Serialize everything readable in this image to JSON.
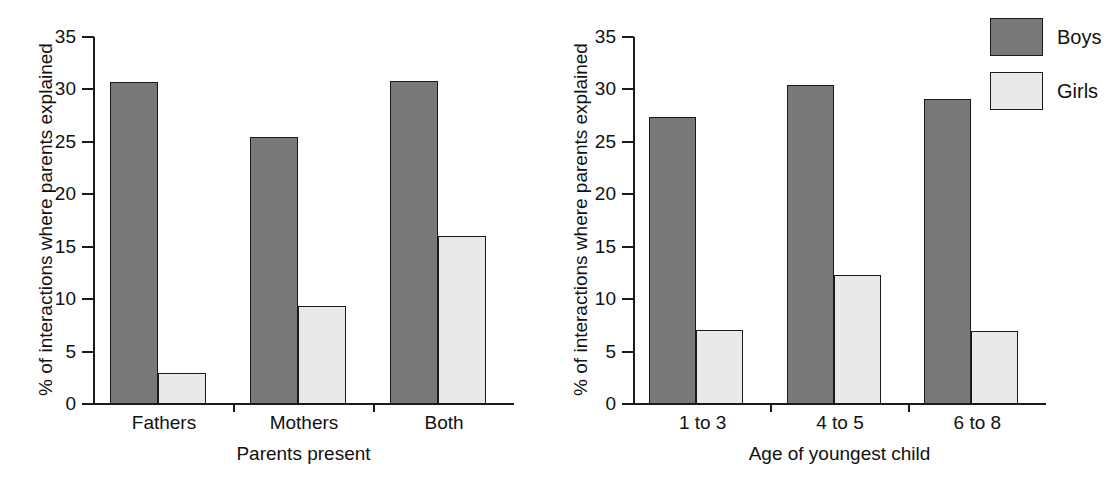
{
  "figure": {
    "background_color": "#ffffff",
    "series_colors": {
      "boys": "#787878",
      "girls": "#e9e9e9",
      "outline": "#1a1a1a"
    }
  },
  "legend": {
    "position": "top-right",
    "entries": [
      {
        "label": "Boys",
        "color": "#787878",
        "swatch": "dark-gray-square"
      },
      {
        "label": "Girls",
        "color": "#e9e9e9",
        "swatch": "light-gray-square"
      }
    ]
  },
  "chart_data": [
    {
      "type": "bar",
      "panel": "left",
      "title": "",
      "xlabel": "Parents present",
      "ylabel": "% of interactions where parents explained",
      "categories": [
        "Fathers",
        "Mothers",
        "Both"
      ],
      "series": [
        {
          "name": "Boys",
          "values": [
            30.7,
            25.5,
            30.8
          ]
        },
        {
          "name": "Girls",
          "values": [
            3.0,
            9.3,
            16.0
          ]
        }
      ],
      "ylim": [
        0,
        35
      ],
      "yticks": [
        0,
        5,
        10,
        15,
        20,
        25,
        30,
        35
      ],
      "ytick_labels": [
        "0",
        "5",
        "10",
        "15",
        "20",
        "25",
        "30",
        "35"
      ],
      "grid": false,
      "legend_position": "outside-top-right"
    },
    {
      "type": "bar",
      "panel": "right",
      "title": "",
      "xlabel": "Age of youngest child",
      "ylabel": "% of interactions where parents explained",
      "categories": [
        "1 to 3",
        "4 to 5",
        "6 to 8"
      ],
      "series": [
        {
          "name": "Boys",
          "values": [
            27.4,
            30.4,
            29.1
          ]
        },
        {
          "name": "Girls",
          "values": [
            7.1,
            12.3,
            7.0
          ]
        }
      ],
      "ylim": [
        0,
        35
      ],
      "yticks": [
        0,
        5,
        10,
        15,
        20,
        25,
        30,
        35
      ],
      "ytick_labels": [
        "0",
        "5",
        "10",
        "15",
        "20",
        "25",
        "30",
        "35"
      ],
      "grid": false,
      "legend_position": "outside-top-right"
    }
  ]
}
